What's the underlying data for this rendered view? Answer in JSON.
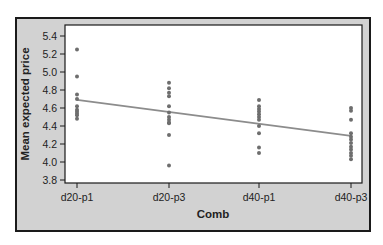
{
  "chart_data": {
    "type": "scatter",
    "title": "",
    "xlabel": "Comb",
    "ylabel": "Mean expected price",
    "categories": [
      "d20-p1",
      "d20-p3",
      "d40-p1",
      "d40-p3"
    ],
    "ylim": [
      3.8,
      5.4
    ],
    "yticks": [
      3.8,
      4.0,
      4.2,
      4.4,
      4.6,
      4.8,
      5.0,
      5.2,
      5.4
    ],
    "grid": false,
    "legend": null,
    "series": [
      {
        "name": "observations",
        "type": "scatter",
        "points": {
          "d20-p1": [
            5.25,
            4.95,
            4.75,
            4.7,
            4.62,
            4.58,
            4.56,
            4.54,
            4.52,
            4.48
          ],
          "d20-p3": [
            4.88,
            4.82,
            4.77,
            4.73,
            4.62,
            4.55,
            4.5,
            4.47,
            4.44,
            4.43,
            4.3,
            3.96
          ],
          "d40-p1": [
            4.69,
            4.62,
            4.59,
            4.56,
            4.53,
            4.5,
            4.47,
            4.4,
            4.32,
            4.16,
            4.1
          ],
          "d40-p3": [
            4.6,
            4.57,
            4.47,
            4.32,
            4.28,
            4.25,
            4.21,
            4.17,
            4.14,
            4.1,
            4.07,
            4.03
          ]
        }
      },
      {
        "name": "fit",
        "type": "line",
        "x": [
          "d20-p1",
          "d40-p3"
        ],
        "y": [
          4.69,
          4.29
        ]
      }
    ],
    "colors": {
      "points": "#6e6e6e",
      "fit_line": "#8c8c8c",
      "frame_bg": "#d2d2d2",
      "plot_bg": "#ffffff"
    }
  }
}
